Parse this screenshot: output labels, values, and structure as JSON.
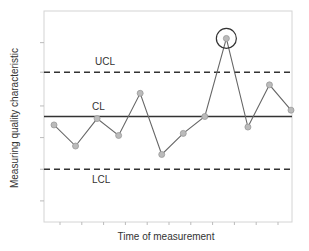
{
  "chart_data": {
    "type": "line",
    "title": "",
    "xlabel": "Time of measurement",
    "ylabel": "Measuring quality characteristic",
    "grid": false,
    "legend": null,
    "x": [
      1,
      2,
      3,
      4,
      5,
      6,
      7,
      8,
      9,
      10,
      11,
      12
    ],
    "series": [
      {
        "name": "Measurements",
        "values": [
          4.6,
          3.6,
          4.9,
          4.1,
          6.1,
          3.2,
          4.2,
          5.0,
          8.7,
          4.5,
          6.5,
          5.3
        ]
      }
    ],
    "control_lines": {
      "UCL": 7.1,
      "CL": 5.0,
      "LCL": 2.5
    },
    "annotations": [
      {
        "label": "UCL",
        "type": "dashed-line"
      },
      {
        "label": "CL",
        "type": "solid-line"
      },
      {
        "label": "LCL",
        "type": "dashed-line"
      },
      {
        "type": "circle",
        "point_index": 8,
        "note": "out-of-control point above UCL"
      }
    ],
    "ylim": [
      0,
      10
    ],
    "y_ticks_labeled": false,
    "x_ticks_labeled": false
  },
  "labels": {
    "ucl": "UCL",
    "cl": "CL",
    "lcl": "LCL",
    "xlabel": "Time of measurement",
    "ylabel": "Measuring quality characteristic"
  },
  "colors": {
    "line": "#555555",
    "marker_fill": "#bbbbbb",
    "control_line": "#333333",
    "axis": "#cccccc"
  }
}
